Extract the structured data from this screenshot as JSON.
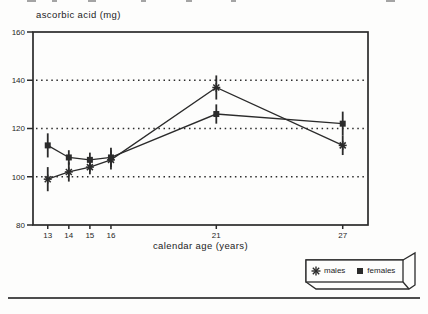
{
  "page": {
    "background": "#fdfdfc",
    "ink": "#2b2b2b"
  },
  "chart_data": {
    "type": "line",
    "title": "ascorbic acid (mg)",
    "xlabel": "calendar age (years)",
    "ylabel": "",
    "x": [
      13,
      14,
      15,
      16,
      21,
      27
    ],
    "x_tick_labels": [
      "13",
      "14",
      "15",
      "16",
      "21",
      "27"
    ],
    "xlim": [
      12.3,
      28.2
    ],
    "y_ticks": [
      80,
      100,
      120,
      140,
      160
    ],
    "ylim": [
      80,
      160
    ],
    "grid_y": [
      100,
      120,
      140
    ],
    "grid_style": "dotted horizontal",
    "legend_position": "outside bottom-right",
    "ink": "#2b2b2b",
    "series": [
      {
        "name": "males",
        "marker": "asterisk",
        "values": [
          99,
          102,
          104,
          107,
          137,
          113
        ],
        "error": [
          5,
          4,
          3,
          4,
          5,
          4
        ]
      },
      {
        "name": "females",
        "marker": "filled-square",
        "values": [
          113,
          108,
          107,
          108,
          126,
          122
        ],
        "error": [
          5,
          3,
          3,
          4,
          4,
          5
        ]
      }
    ]
  },
  "legend": {
    "items": [
      {
        "label": "males",
        "marker": "asterisk"
      },
      {
        "label": "females",
        "marker": "filled-square"
      }
    ]
  }
}
